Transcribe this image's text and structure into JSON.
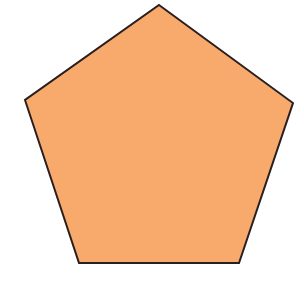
{
  "figure": {
    "shape": "regular-pentagon",
    "fill_color": "#F7AA6B",
    "stroke_color": "#2a1f1f",
    "stroke_width": 2,
    "vertices": [
      {
        "x": 159,
        "y": 5
      },
      {
        "x": 293,
        "y": 103
      },
      {
        "x": 239,
        "y": 263
      },
      {
        "x": 79,
        "y": 263
      },
      {
        "x": 25,
        "y": 100
      }
    ]
  },
  "background_color": "#ffffff"
}
